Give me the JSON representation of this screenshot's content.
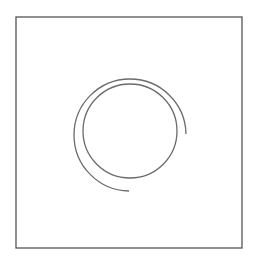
{
  "figure": {
    "colors": {
      "background": "#ffffff",
      "frame_stroke": "#555555",
      "shape_stroke": "#6a6a6a"
    },
    "frame": {
      "x": 16,
      "y": 17,
      "width": 226,
      "height": 231
    },
    "inner_circle": {
      "cx": 130,
      "cy": 131,
      "r": 47
    },
    "outer_arc": {
      "cx": 130,
      "cy": 131,
      "r": 56,
      "start": {
        "x": 186,
        "y": 134
      },
      "end": {
        "x": 129,
        "y": 191
      },
      "sweep": "counterclockwise from right, over top and left, ending at bottom"
    }
  }
}
